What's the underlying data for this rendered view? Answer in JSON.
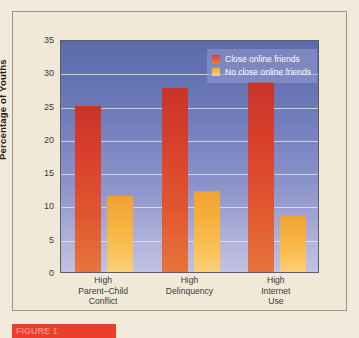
{
  "chart_data": {
    "type": "bar",
    "title": "",
    "xlabel": "",
    "ylabel": "Percentage of Youths",
    "ylim": [
      0,
      35
    ],
    "ytick_step": 5,
    "yticks": [
      "35",
      "30",
      "25",
      "20",
      "15",
      "10",
      "5",
      "0"
    ],
    "grid": true,
    "legend_position": "top-right",
    "categories": [
      "High\nParent–Child\nConflict",
      "High\nDelinquency",
      "High\nInternet\nUse"
    ],
    "category_lines": [
      [
        "High",
        "Parent–Child",
        "Conflict"
      ],
      [
        "High",
        "Delinquency"
      ],
      [
        "High",
        "Internet",
        "Use"
      ]
    ],
    "series": [
      {
        "name": "Close online friends",
        "color": "#d8402c",
        "values": [
          24.9,
          27.6,
          28.6
        ]
      },
      {
        "name": "No close online friends",
        "color": "#f6b03c",
        "values": [
          11.4,
          12.2,
          8.6
        ]
      }
    ]
  },
  "legend": {
    "items": [
      {
        "label": "Close online friends"
      },
      {
        "label": "No close online friends"
      }
    ]
  },
  "caption": {
    "text": "FIGURE 1"
  },
  "colors": {
    "background": "#f2ebdb",
    "plot_top": "#5b6bac",
    "plot_bottom": "#c3c1e4",
    "series_close": "#d8402c",
    "series_noclose": "#f6b03c",
    "caption_chip": "#e8402a"
  }
}
